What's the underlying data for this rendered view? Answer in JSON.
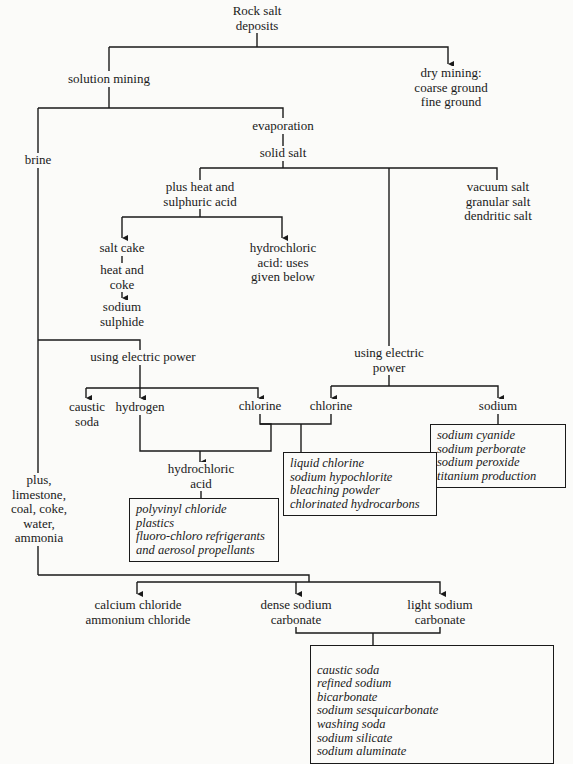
{
  "title": "Rock salt deposits",
  "nodes": {
    "root": "Rock salt\ndeposits",
    "solution_mining": "solution mining",
    "dry_mining": "dry mining:\ncoarse ground\nfine ground",
    "evaporation": "evaporation",
    "solid_salt": "solid salt",
    "brine": "brine",
    "plus_heat": "plus heat and\nsulphuric acid",
    "vacuum_salt": "vacuum salt\ngranular salt\ndendritic salt",
    "salt_cake": "salt cake",
    "heat_coke": "heat and\ncoke",
    "sodium_sulphide": "sodium\nsulphide",
    "hcl_uses": "hydrochloric\nacid: uses\ngiven below",
    "electric_power_1": "using electric power",
    "electric_power_2": "using electric\npower",
    "caustic_soda": "caustic\nsoda",
    "hydrogen": "hydrogen",
    "chlorine_1": "chlorine",
    "chlorine_2": "chlorine",
    "sodium": "sodium",
    "hydrochloric_acid": "hydrochloric\nacid",
    "plus_limestone": "plus,\nlimestone,\ncoal, coke,\nwater,\nammonia",
    "calcium_chloride": "calcium chloride\nammonium chloride",
    "dense_carbonate": "dense sodium\ncarbonate",
    "light_carbonate": "light sodium\ncarbonate"
  },
  "boxes": {
    "sodium_uses": "sodium cyanide\nsodium perborate\nsodium peroxide\ntitanium production",
    "chlorine_uses": "liquid chlorine\nsodium hypochlorite\nbleaching powder\nchlorinated hydrocarbons",
    "hcl_products": "polyvinyl chloride\nplastics\nfluoro-chloro refrigerants\nand aerosol propellants",
    "carbonate_uses_left": "caustic soda\nrefined sodium\n   bicarbonate\nsodium sesquicarbonate\nwashing soda",
    "carbonate_uses_right": "sodium silicate\nsodium aluminate"
  }
}
